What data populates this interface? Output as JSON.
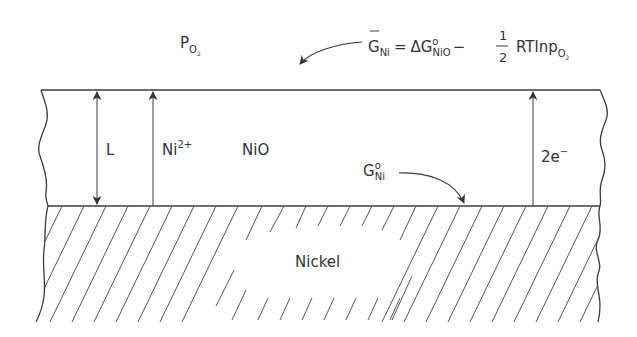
{
  "diagram": {
    "gas_label": {
      "main": "P",
      "sub": "O",
      "subsub": "2"
    },
    "surface_equation": {
      "lhs_main": "G",
      "lhs_sub": "Ni",
      "equals": "=",
      "delta": "Δ",
      "term1_main": "G",
      "term1_sup": "o",
      "term1_sub": "NiO",
      "minus": "−",
      "frac_num": "1",
      "frac_den": "2",
      "term2": "RTlnp",
      "term2_sub": "O",
      "term2_subsub": "2"
    },
    "oxide_layer": {
      "name": "NiO",
      "thickness_label": "L",
      "cation_flux_label": {
        "main": "Ni",
        "sup": "2+"
      },
      "electron_flux_label": {
        "main": "2e",
        "sup": "−"
      }
    },
    "interface_label": {
      "main": "G",
      "sup": "o",
      "sub": "Ni"
    },
    "metal": {
      "name": "Nickel"
    },
    "colors": {
      "ink": "#333333",
      "background": "#ffffff"
    }
  }
}
